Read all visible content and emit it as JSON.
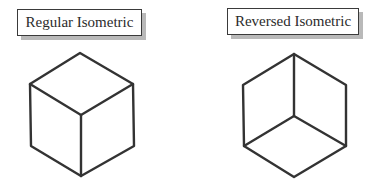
{
  "figures": [
    {
      "id": "regular",
      "label": "Regular Isometric",
      "description": "Cube viewed from above: top face visible, interior Y-junction at center pointing down",
      "vertices": {
        "top": [
          80,
          53
        ],
        "upper_left": [
          30,
          84
        ],
        "upper_right": [
          133,
          84
        ],
        "center": [
          81,
          115
        ],
        "lower_left": [
          31,
          146
        ],
        "lower_right": [
          134,
          146
        ],
        "bottom": [
          81,
          176
        ]
      }
    },
    {
      "id": "reversed",
      "label": "Reversed Isometric",
      "description": "Cube viewed from below: bottom face visible, interior Y-junction at center pointing up",
      "vertices": {
        "top": [
          294,
          54
        ],
        "upper_left": [
          243,
          85
        ],
        "upper_right": [
          346,
          85
        ],
        "center": [
          294,
          116
        ],
        "lower_left": [
          244,
          146
        ],
        "lower_right": [
          346,
          146
        ],
        "bottom": [
          294,
          177
        ]
      }
    }
  ],
  "colors": {
    "line": "#333333",
    "box_border": "#3a3a3a",
    "box_shadow": "#b9b9b9",
    "background": "#ffffff"
  }
}
